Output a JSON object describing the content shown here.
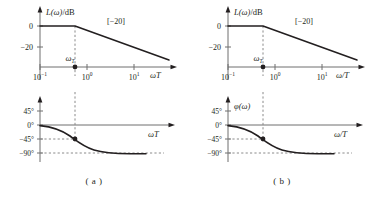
{
  "figure": {
    "panels": [
      {
        "id": "a",
        "caption": "( a )",
        "magnitude": {
          "yaxis_label": "L(ω)/dB",
          "xaxis_label": "ωT",
          "slope_annotation": "[−20]",
          "corner_marker_label": "ω",
          "corner_marker_sub": "T",
          "yticks": [
            "0",
            "−20"
          ],
          "ytick_values": [
            0,
            -20
          ],
          "xticks": [
            {
              "mantissa": "10",
              "exponent": "−1"
            },
            {
              "mantissa": "10",
              "exponent": "0"
            },
            {
              "mantissa": "10",
              "exponent": "1"
            }
          ]
        },
        "phase": {
          "yaxis_label": "",
          "xaxis_label": "ωT",
          "yticks": [
            "45°",
            "0°",
            "−45°",
            "−90°"
          ],
          "ytick_values": [
            45,
            0,
            -45,
            -90
          ]
        }
      },
      {
        "id": "b",
        "caption": "( b )",
        "magnitude": {
          "yaxis_label": "L(ω)/dB",
          "xaxis_label": "ω/T",
          "slope_annotation": "[−20]",
          "corner_marker_label": "ω",
          "corner_marker_sub": "T",
          "yticks": [
            "0",
            "−20"
          ],
          "ytick_values": [
            0,
            -20
          ],
          "xticks": [
            {
              "mantissa": "10",
              "exponent": "−1"
            },
            {
              "mantissa": "10",
              "exponent": "0"
            },
            {
              "mantissa": "10",
              "exponent": "1"
            }
          ]
        },
        "phase": {
          "yaxis_label": "φ(ω)",
          "xaxis_label": "ω/T",
          "yticks": [
            "45°",
            "0°",
            "−45°",
            "−90°"
          ],
          "ytick_values": [
            45,
            0,
            -45,
            -90
          ]
        }
      }
    ]
  },
  "chart_data": [
    {
      "type": "line",
      "panel": "a",
      "subplot": "magnitude",
      "title": "",
      "xlabel": "ωT",
      "ylabel": "L(ω)/dB",
      "xscale": "log",
      "xlim": [
        0.1,
        30
      ],
      "ylim": [
        -32,
        8
      ],
      "xtick_labels": [
        "10⁻¹",
        "10⁰",
        "10¹"
      ],
      "xtick_values": [
        0.1,
        1,
        10
      ],
      "ytick_labels": [
        "0",
        "−20"
      ],
      "ytick_values": [
        0,
        -20
      ],
      "grid": false,
      "legend": null,
      "annotations": [
        {
          "text": "[−20]",
          "x": 4.0,
          "y": 1.5,
          "note": "slope of asymptote in dB/decade"
        },
        {
          "text": "ωT",
          "x": 0.55,
          "y": -29,
          "note": "corner frequency marker label, subscript T"
        }
      ],
      "corner_frequency": 0.55,
      "series": [
        {
          "name": "asymptotic magnitude",
          "x": [
            0.1,
            0.55,
            30
          ],
          "values": [
            0,
            0,
            -34.7
          ],
          "note": "flat 0 dB up to corner, then −20 dB/decade"
        }
      ],
      "guides": [
        {
          "type": "vline",
          "x": 0.55,
          "style": "dashed",
          "note": "corner frequency"
        }
      ],
      "markers": [
        {
          "x": 0.55,
          "y": -32,
          "note": "dot on x-axis at corner frequency"
        }
      ]
    },
    {
      "type": "line",
      "panel": "a",
      "subplot": "phase",
      "title": "",
      "xlabel": "ωT",
      "ylabel": "",
      "xscale": "log",
      "xlim": [
        0.1,
        30
      ],
      "ylim": [
        -100,
        60
      ],
      "ytick_labels": [
        "45°",
        "0°",
        "−45°",
        "−90°"
      ],
      "ytick_values": [
        45,
        0,
        -45,
        -90
      ],
      "grid": false,
      "legend": null,
      "corner_frequency": 0.55,
      "series": [
        {
          "name": "phase",
          "x": [
            0.1,
            0.18,
            0.32,
            0.55,
            0.95,
            1.7,
            3.0,
            5.5,
            10,
            20
          ],
          "values": [
            -2,
            -5,
            -14,
            -45,
            -65,
            -78,
            -85,
            -88,
            -89,
            -90
          ],
          "note": "arctangent phase from 0° to −90°"
        }
      ],
      "guides": [
        {
          "type": "vline",
          "x": 0.55,
          "style": "dashed"
        },
        {
          "type": "hline",
          "y": -45,
          "style": "dashed"
        },
        {
          "type": "hline",
          "y": -90,
          "style": "dashed"
        }
      ],
      "markers": [
        {
          "x": 0.55,
          "y": -45,
          "note": "phase at corner frequency"
        }
      ]
    },
    {
      "type": "line",
      "panel": "b",
      "subplot": "magnitude",
      "title": "",
      "xlabel": "ω/T",
      "ylabel": "L(ω)/dB",
      "xscale": "log",
      "xlim": [
        0.1,
        30
      ],
      "ylim": [
        -32,
        8
      ],
      "xtick_labels": [
        "10⁻¹",
        "10⁰",
        "10¹"
      ],
      "xtick_values": [
        0.1,
        1,
        10
      ],
      "ytick_labels": [
        "0",
        "−20"
      ],
      "ytick_values": [
        0,
        -20
      ],
      "grid": false,
      "legend": null,
      "annotations": [
        {
          "text": "[−20]",
          "x": 4.0,
          "y": 1.5
        },
        {
          "text": "ωT",
          "x": 0.55,
          "y": -29
        }
      ],
      "corner_frequency": 0.55,
      "series": [
        {
          "name": "asymptotic magnitude",
          "x": [
            0.1,
            0.55,
            30
          ],
          "values": [
            0,
            0,
            -34.7
          ]
        }
      ],
      "guides": [
        {
          "type": "vline",
          "x": 0.55,
          "style": "dashed"
        }
      ],
      "markers": [
        {
          "x": 0.55,
          "y": -32
        }
      ]
    },
    {
      "type": "line",
      "panel": "b",
      "subplot": "phase",
      "title": "",
      "xlabel": "ω/T",
      "ylabel": "φ(ω)",
      "xscale": "log",
      "xlim": [
        0.1,
        30
      ],
      "ylim": [
        -100,
        60
      ],
      "ytick_labels": [
        "45°",
        "0°",
        "−45°",
        "−90°"
      ],
      "ytick_values": [
        45,
        0,
        -45,
        -90
      ],
      "grid": false,
      "legend": null,
      "corner_frequency": 0.55,
      "series": [
        {
          "name": "phase",
          "x": [
            0.1,
            0.18,
            0.32,
            0.55,
            0.95,
            1.7,
            3.0,
            5.5,
            10,
            20
          ],
          "values": [
            -2,
            -5,
            -14,
            -45,
            -65,
            -78,
            -85,
            -88,
            -89,
            -90
          ]
        }
      ],
      "guides": [
        {
          "type": "vline",
          "x": 0.55,
          "style": "dashed"
        },
        {
          "type": "hline",
          "y": -45,
          "style": "dashed"
        },
        {
          "type": "hline",
          "y": -90,
          "style": "dashed"
        }
      ],
      "markers": [
        {
          "x": 0.55,
          "y": -45
        }
      ]
    }
  ]
}
